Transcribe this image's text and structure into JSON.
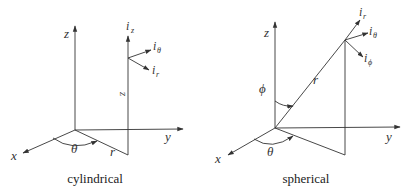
{
  "diagrams": [
    {
      "id": "cylindrical",
      "caption": "cylindrical",
      "axes": {
        "x": "x",
        "y": "y",
        "z": "z"
      },
      "angle_labels": {
        "theta": "θ"
      },
      "length_labels": {
        "r": "r",
        "z": "z"
      },
      "unit_vectors": [
        {
          "base": "i",
          "sub": "z"
        },
        {
          "base": "i",
          "sub": "θ"
        },
        {
          "base": "i",
          "sub": "r"
        }
      ]
    },
    {
      "id": "spherical",
      "caption": "spherical",
      "axes": {
        "x": "x",
        "y": "y",
        "z": "z"
      },
      "angle_labels": {
        "theta": "θ",
        "phi": "ϕ"
      },
      "length_labels": {
        "r": "r"
      },
      "unit_vectors": [
        {
          "base": "i",
          "sub": "r"
        },
        {
          "base": "i",
          "sub": "θ"
        },
        {
          "base": "i",
          "sub": "ϕ"
        }
      ]
    }
  ],
  "colors": {
    "line": "#333333",
    "background": "#ffffff"
  }
}
